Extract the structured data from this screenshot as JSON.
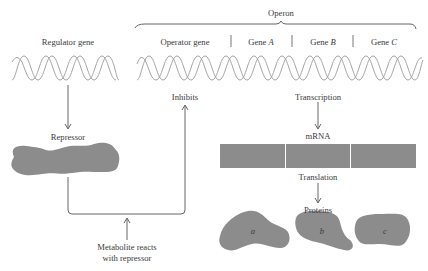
{
  "operon": {
    "title": "Operon",
    "segments": [
      {
        "label": "Operator gene"
      },
      {
        "label_prefix": "Gene ",
        "label_letter": "A"
      },
      {
        "label_prefix": "Gene ",
        "label_letter": "B"
      },
      {
        "label_prefix": "Gene ",
        "label_letter": "C"
      }
    ]
  },
  "regulator": {
    "gene_label": "Regulator gene",
    "product_label": "Repressor"
  },
  "flow": {
    "inhibits": "Inhibits",
    "transcription": "Transcription",
    "mrna": "mRNA",
    "translation": "Translation",
    "proteins": "Proteins",
    "metabolite_line1": "Metabolite reacts",
    "metabolite_line2": "with repressor"
  },
  "proteins": [
    {
      "label": "a"
    },
    {
      "label": "b"
    },
    {
      "label": "c"
    }
  ],
  "colors": {
    "shape_fill": "#8c8c8c",
    "line": "#555555",
    "dna": "#9a9a9a",
    "text": "#3a3a3a"
  }
}
